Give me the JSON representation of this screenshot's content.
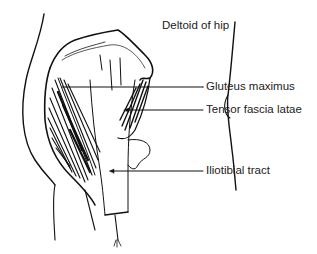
{
  "figure": {
    "title": "Deltoid of hip",
    "labels": [
      {
        "id": "gluteus",
        "text": "Gluteus maximus"
      },
      {
        "id": "tensor",
        "text": "Tensor fascia latae"
      },
      {
        "id": "iliotibial",
        "text": "Iliotibial tract"
      }
    ],
    "colors": {
      "ink": "#111111",
      "background": "#ffffff"
    }
  }
}
